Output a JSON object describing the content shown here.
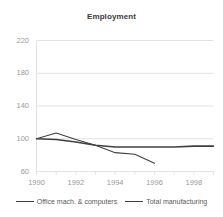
{
  "chart_data": {
    "type": "line",
    "title": "Employment",
    "xlabel": "",
    "ylabel": "",
    "xlim": [
      1990,
      1999
    ],
    "ylim": [
      60,
      220
    ],
    "yticks": [
      60,
      100,
      140,
      180,
      220
    ],
    "xticks": [
      1990,
      1992,
      1994,
      1996,
      1998
    ],
    "x_minor_ticks": [
      1991,
      1993,
      1995,
      1997,
      1999
    ],
    "grid": true,
    "grid_axis": "y",
    "legend_position": "bottom",
    "series": [
      {
        "name": "Office mach. & computers",
        "color": "#404040",
        "x": [
          1990,
          1991,
          1992,
          1993,
          1994,
          1995,
          1996
        ],
        "values": [
          100,
          107,
          99,
          92,
          83,
          81,
          70
        ]
      },
      {
        "name": "Total manufacturing",
        "color": "#404040",
        "x": [
          1990,
          1991,
          1992,
          1993,
          1994,
          1995,
          1996,
          1997,
          1998,
          1999
        ],
        "values": [
          100,
          99,
          96,
          92,
          90,
          90,
          90,
          90,
          91,
          91
        ]
      }
    ]
  },
  "axes": {
    "y_tick_labels": [
      "220",
      "180",
      "140",
      "100",
      "60"
    ],
    "x_tick_labels": [
      "1990",
      "1992",
      "1994",
      "1996",
      "1998"
    ]
  },
  "legend": {
    "entries": [
      {
        "label": "Office mach. & computers"
      },
      {
        "label": "Total manufacturing"
      }
    ]
  },
  "colors": {
    "series_line": "#404040",
    "grid": "#e2e2e2",
    "tick_text": "#9a9a9a",
    "title_text": "#3b3b3b",
    "background": "#ffffff"
  }
}
